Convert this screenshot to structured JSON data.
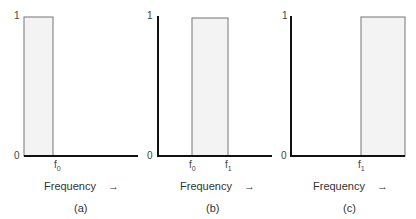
{
  "panels": [
    {
      "id": "a",
      "caption": "(a)",
      "y_top_label": "1",
      "y_bottom_label": "0",
      "x_axis_label": "Frequency",
      "x_axis_arrow": "→",
      "ticks": [
        {
          "base": "f",
          "sub": "0"
        }
      ],
      "band": "lowpass"
    },
    {
      "id": "b",
      "caption": "(b)",
      "y_top_label": "1",
      "y_bottom_label": "0",
      "x_axis_label": "Frequency",
      "x_axis_arrow": "→",
      "ticks": [
        {
          "base": "f",
          "sub": "0"
        },
        {
          "base": "f",
          "sub": "1"
        }
      ],
      "band": "bandpass"
    },
    {
      "id": "c",
      "caption": "(c)",
      "y_top_label": "1",
      "y_bottom_label": "0",
      "x_axis_label": "Frequency",
      "x_axis_arrow": "→",
      "ticks": [
        {
          "base": "f",
          "sub": "1"
        }
      ],
      "band": "highpass"
    }
  ],
  "colors": {
    "axis": "#111111",
    "band_fill": "#f3f3f3",
    "band_stroke": "#8a8a8a"
  }
}
